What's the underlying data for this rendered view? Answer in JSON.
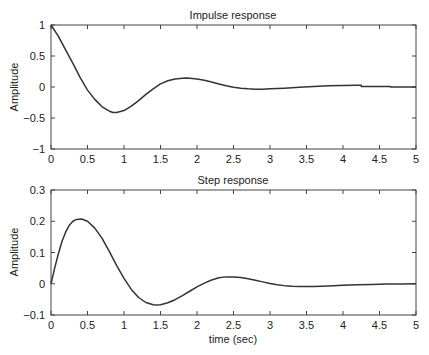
{
  "chart_data": [
    {
      "type": "line",
      "title": "Impulse response",
      "xlabel": "",
      "ylabel": "Amplitude",
      "xlim": [
        0,
        5
      ],
      "ylim": [
        -1,
        1
      ],
      "xticks": [
        0,
        0.5,
        1,
        1.5,
        2,
        2.5,
        3,
        3.5,
        4,
        4.5,
        5
      ],
      "xtick_labels": [
        "0",
        "0.5",
        "1",
        "1.5",
        "2",
        "2.5",
        "3",
        "3.5",
        "4",
        "4.5",
        "5"
      ],
      "yticks": [
        -1,
        -0.5,
        0,
        0.5,
        1
      ],
      "ytick_labels": [
        "−1",
        "−0.5",
        "0",
        "0.5",
        "1"
      ],
      "grid": false,
      "series": [
        {
          "name": "impulse",
          "x": [
            0,
            0.1,
            0.2,
            0.3,
            0.4,
            0.5,
            0.6,
            0.7,
            0.8,
            0.85,
            0.9,
            1.0,
            1.1,
            1.2,
            1.3,
            1.4,
            1.5,
            1.6,
            1.7,
            1.8,
            1.86,
            1.9,
            2.0,
            2.1,
            2.2,
            2.3,
            2.4,
            2.5,
            2.6,
            2.7,
            2.8,
            2.9,
            3.0,
            3.2,
            3.4,
            3.6,
            3.8,
            4.0,
            4.2,
            4.25,
            4.25,
            4.65,
            4.65,
            5.0
          ],
          "y": [
            1.0,
            0.82,
            0.6,
            0.38,
            0.15,
            -0.05,
            -0.2,
            -0.32,
            -0.39,
            -0.41,
            -0.41,
            -0.38,
            -0.31,
            -0.22,
            -0.12,
            -0.03,
            0.05,
            0.1,
            0.13,
            0.14,
            0.145,
            0.14,
            0.13,
            0.11,
            0.08,
            0.05,
            0.02,
            -0.005,
            -0.02,
            -0.03,
            -0.035,
            -0.035,
            -0.03,
            -0.02,
            -0.005,
            0.01,
            0.02,
            0.025,
            0.03,
            0.03,
            0.01,
            0.01,
            0.0,
            0.0
          ]
        }
      ]
    },
    {
      "type": "line",
      "title": "Step response",
      "xlabel": "time (sec)",
      "ylabel": "Amplitude",
      "xlim": [
        0,
        5
      ],
      "ylim": [
        -0.1,
        0.3
      ],
      "xticks": [
        0,
        0.5,
        1,
        1.5,
        2,
        2.5,
        3,
        3.5,
        4,
        4.5,
        5
      ],
      "xtick_labels": [
        "0",
        "0.5",
        "1",
        "1.5",
        "2",
        "2.5",
        "3",
        "3.5",
        "4",
        "4.5",
        "5"
      ],
      "yticks": [
        -0.1,
        0,
        0.1,
        0.2,
        0.3
      ],
      "ytick_labels": [
        "−0.1",
        "0",
        "0.1",
        "0.2",
        "0.3"
      ],
      "grid": false,
      "series": [
        {
          "name": "step",
          "x": [
            0,
            0.05,
            0.1,
            0.15,
            0.2,
            0.25,
            0.3,
            0.35,
            0.42,
            0.5,
            0.6,
            0.7,
            0.8,
            0.9,
            1.0,
            1.1,
            1.2,
            1.3,
            1.4,
            1.45,
            1.5,
            1.6,
            1.7,
            1.8,
            1.9,
            2.0,
            2.1,
            2.2,
            2.3,
            2.4,
            2.5,
            2.6,
            2.7,
            2.8,
            2.9,
            3.0,
            3.1,
            3.2,
            3.3,
            3.4,
            3.5,
            3.6,
            3.8,
            4.0,
            4.2,
            4.4,
            4.6,
            4.8,
            5.0
          ],
          "y": [
            0.0,
            0.05,
            0.095,
            0.135,
            0.165,
            0.187,
            0.2,
            0.206,
            0.207,
            0.2,
            0.178,
            0.145,
            0.103,
            0.058,
            0.017,
            -0.018,
            -0.044,
            -0.06,
            -0.067,
            -0.068,
            -0.067,
            -0.061,
            -0.051,
            -0.038,
            -0.024,
            -0.01,
            0.002,
            0.012,
            0.019,
            0.022,
            0.022,
            0.02,
            0.016,
            0.011,
            0.006,
            0.001,
            -0.003,
            -0.006,
            -0.008,
            -0.009,
            -0.009,
            -0.009,
            -0.007,
            -0.005,
            -0.003,
            -0.002,
            -0.001,
            -0.001,
            0.0
          ]
        }
      ]
    }
  ],
  "panels": [
    {
      "title": "Impulse response",
      "ylabel": "Amplitude",
      "xlabel": ""
    },
    {
      "title": "Step response",
      "ylabel": "Amplitude",
      "xlabel": "time (sec)"
    }
  ]
}
